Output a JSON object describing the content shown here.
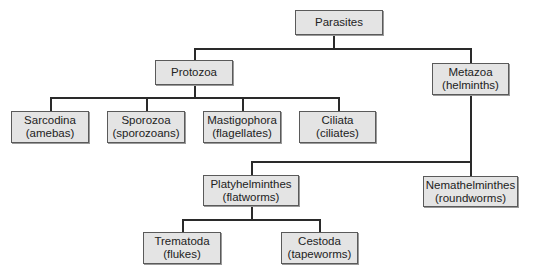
{
  "diagram": {
    "type": "tree",
    "root": "parasites",
    "nodes": {
      "parasites": {
        "label": "Parasites",
        "sublabel": ""
      },
      "protozoa": {
        "label": "Protozoa",
        "sublabel": ""
      },
      "metazoa": {
        "label": "Metazoa",
        "sublabel": "(helminths)"
      },
      "sarcodina": {
        "label": "Sarcodina",
        "sublabel": "(amebas)"
      },
      "sporozoa": {
        "label": "Sporozoa",
        "sublabel": "(sporozoans)"
      },
      "mastigophora": {
        "label": "Mastigophora",
        "sublabel": "(flagellates)"
      },
      "ciliata": {
        "label": "Ciliata",
        "sublabel": "(ciliates)"
      },
      "platyhelminthes": {
        "label": "Platyhelminthes",
        "sublabel": "(flatworms)"
      },
      "nemathelminthes": {
        "label": "Nemathelminthes",
        "sublabel": "(roundworms)"
      },
      "trematoda": {
        "label": "Trematoda",
        "sublabel": "(flukes)"
      },
      "cestoda": {
        "label": "Cestoda",
        "sublabel": "(tapeworms)"
      }
    },
    "edges": [
      [
        "parasites",
        "protozoa"
      ],
      [
        "parasites",
        "metazoa"
      ],
      [
        "protozoa",
        "sarcodina"
      ],
      [
        "protozoa",
        "sporozoa"
      ],
      [
        "protozoa",
        "mastigophora"
      ],
      [
        "protozoa",
        "ciliata"
      ],
      [
        "metazoa",
        "platyhelminthes"
      ],
      [
        "metazoa",
        "nemathelminthes"
      ],
      [
        "platyhelminthes",
        "trematoda"
      ],
      [
        "platyhelminthes",
        "cestoda"
      ]
    ],
    "colors": {
      "box_fill": "#e4e4e4",
      "box_border": "#5a5a5a",
      "line": "#2a2a2a"
    }
  }
}
